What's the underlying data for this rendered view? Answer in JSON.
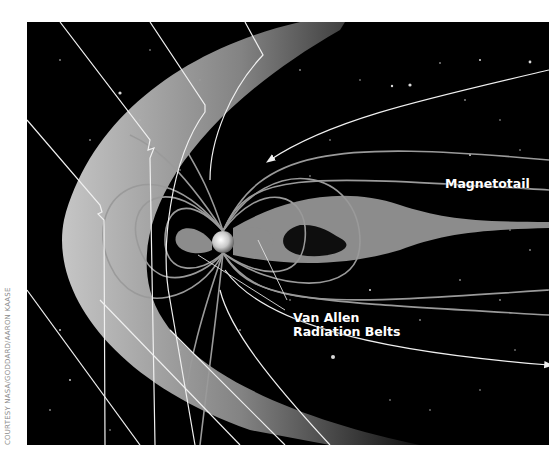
{
  "figure": {
    "labels": {
      "magnetotail": "Magnetotail",
      "van_allen_line1": "Van Allen",
      "van_allen_line2": "Radiation Belts"
    },
    "credit": "COURTESY NASA/GODDARD/AARON KAASE"
  },
  "colors": {
    "background": "#000000",
    "bow_shock": "#bdbdbd",
    "field_lines": "#9a9a9a",
    "solar_wind_lines": "#f0f0f0",
    "belts": "#8c8c8c",
    "label_text": "#ffffff"
  }
}
